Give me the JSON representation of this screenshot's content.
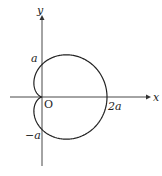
{
  "diagram": {
    "type": "polar-curve",
    "curve": "cardioid r = a(1 + cos θ)",
    "axes": {
      "x_label": "x",
      "y_label": "y",
      "origin_label": "O"
    },
    "tick_labels": {
      "y_pos": "a",
      "y_neg": "−a",
      "x_pos": "2a"
    },
    "colors": {
      "stroke": "#222222",
      "background": "#ffffff"
    }
  }
}
